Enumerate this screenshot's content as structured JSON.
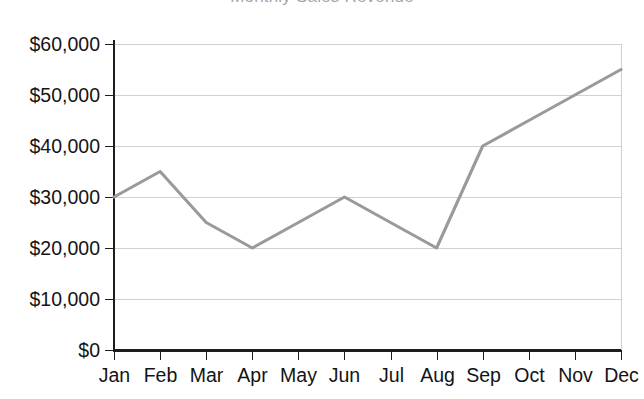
{
  "chart_data": {
    "type": "line",
    "title": "Monthly Sales Revenue",
    "xlabel": "",
    "ylabel": "",
    "categories": [
      "Jan",
      "Feb",
      "Mar",
      "Apr",
      "May",
      "Jun",
      "Jul",
      "Aug",
      "Sep",
      "Oct",
      "Nov",
      "Dec"
    ],
    "series": [
      {
        "name": "Revenue",
        "color": "#9a9a9a",
        "values": [
          30000,
          35000,
          25000,
          20000,
          25000,
          30000,
          25000,
          20000,
          40000,
          45000,
          50000,
          55000
        ]
      }
    ],
    "ylim": [
      0,
      60000
    ],
    "ytick_values": [
      0,
      10000,
      20000,
      30000,
      40000,
      50000,
      60000
    ],
    "ytick_labels": [
      "$0",
      "$10,000",
      "$20,000",
      "$30,000",
      "$40,000",
      "$50,000",
      "$60,000"
    ],
    "grid": true,
    "grid_axis": "y",
    "legend": false,
    "legend_position": "none",
    "markers": false
  },
  "figure": {
    "background_color": "#ffffff",
    "grid_color": "#d2d2d2",
    "axis_color": "#1d1d1d",
    "text_color": "#141414"
  }
}
